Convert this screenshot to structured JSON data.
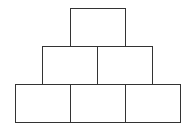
{
  "diagram": {
    "type": "pyramid-of-boxes",
    "line_color": "#333333",
    "rows": [
      {
        "boxes": [
          {
            "x": 70,
            "y": 8,
            "w": 56,
            "h": 40
          }
        ]
      },
      {
        "boxes": [
          {
            "x": 42,
            "y": 46,
            "w": 56,
            "h": 39
          },
          {
            "x": 97,
            "y": 46,
            "w": 56,
            "h": 39
          }
        ]
      },
      {
        "boxes": [
          {
            "x": 15,
            "y": 84,
            "w": 56,
            "h": 39
          },
          {
            "x": 70,
            "y": 84,
            "w": 56,
            "h": 39
          },
          {
            "x": 125,
            "y": 84,
            "w": 56,
            "h": 39
          }
        ]
      }
    ]
  }
}
